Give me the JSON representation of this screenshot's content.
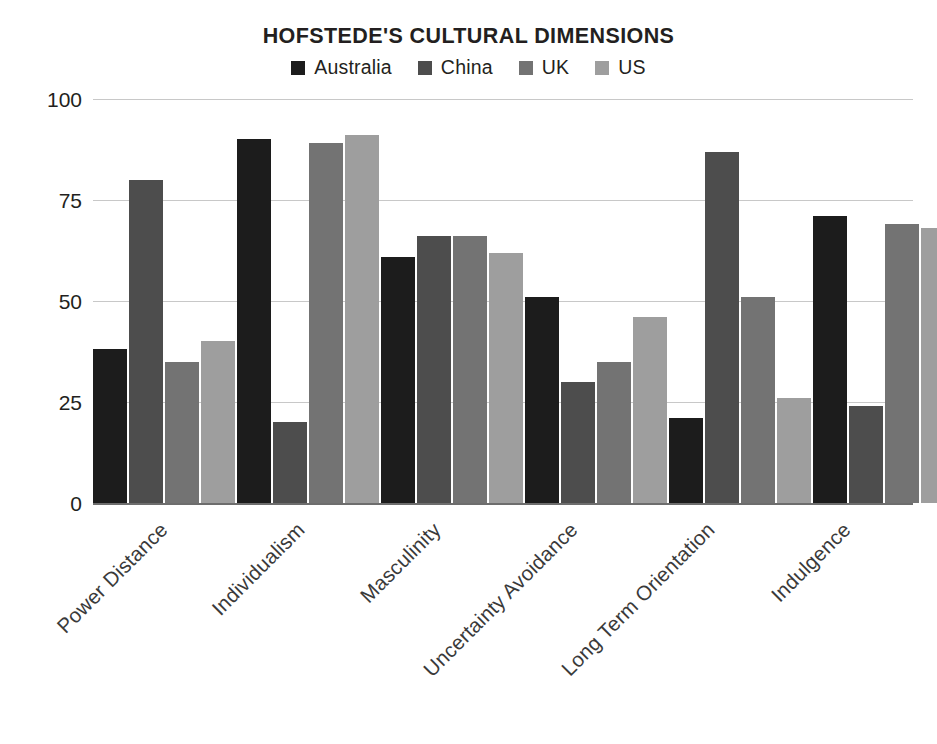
{
  "chart_data": {
    "type": "bar",
    "title": "HOFSTEDE'S CULTURAL DIMENSIONS",
    "subtitle": "",
    "xlabel": "",
    "ylabel": "",
    "ylim": [
      0,
      100
    ],
    "yticks": [
      0,
      25,
      50,
      75,
      100
    ],
    "grid": true,
    "legend_position": "top",
    "categories": [
      "Power Distance",
      "Individualism",
      "Masculinity",
      "Uncertainty Avoidance",
      "Long Term Orientation",
      "Indulgence"
    ],
    "series": [
      {
        "name": "Australia",
        "color": "#1c1c1c",
        "values": [
          38,
          90,
          61,
          51,
          21,
          71
        ]
      },
      {
        "name": "China",
        "color": "#4d4d4d",
        "values": [
          80,
          20,
          66,
          30,
          87,
          24
        ]
      },
      {
        "name": "UK",
        "color": "#737373",
        "values": [
          35,
          89,
          66,
          35,
          51,
          69
        ]
      },
      {
        "name": "US",
        "color": "#9e9e9e",
        "values": [
          40,
          91,
          62,
          46,
          26,
          68
        ]
      }
    ]
  },
  "axis": {
    "tick_labels": [
      "100",
      "75",
      "50",
      "25",
      "0"
    ],
    "gridline_color": "#c8c8c8",
    "baseline_color": "#6d6d6d"
  },
  "legend": {
    "items": [
      {
        "label": "Australia",
        "color": "#1c1c1c"
      },
      {
        "label": "China",
        "color": "#4d4d4d"
      },
      {
        "label": "UK",
        "color": "#737373"
      },
      {
        "label": "US",
        "color": "#9e9e9e"
      }
    ]
  }
}
